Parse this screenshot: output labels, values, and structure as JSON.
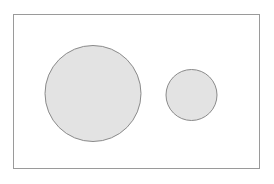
{
  "figure": {
    "canvas": {
      "width": 274,
      "height": 184,
      "background_color": "#ffffff"
    },
    "frame": {
      "name": "bounding-rectangle",
      "x": 13.5,
      "y": 14.5,
      "width": 246,
      "height": 154,
      "fill_color": "#ffffff",
      "stroke_color": "#9a9a9a",
      "stroke_width": 1
    },
    "shapes": [
      {
        "name": "large-circle",
        "type": "circle",
        "cx": 93,
        "cy": 93.5,
        "r": 48,
        "diameter": 96,
        "fill_color": "#e3e3e3",
        "stroke_color": "#8a8a8a",
        "stroke_width": 1
      },
      {
        "name": "small-circle",
        "type": "circle",
        "cx": 191.5,
        "cy": 95,
        "r": 25.5,
        "diameter": 51,
        "fill_color": "#e3e3e3",
        "stroke_color": "#8a8a8a",
        "stroke_width": 1
      }
    ]
  },
  "chart_data": {
    "type": "scatter",
    "title": "",
    "xlabel": "",
    "ylabel": "",
    "xlim": [
      13.5,
      259.5
    ],
    "ylim": [
      14.5,
      168.5
    ],
    "grid": false,
    "legend": "none",
    "categories": [
      "large-circle",
      "small-circle"
    ],
    "values": [
      96,
      51
    ],
    "series": [
      {
        "name": "circle diameter (px)",
        "values": [
          96,
          51
        ]
      },
      {
        "name": "circle center x (px)",
        "values": [
          93,
          191.5
        ]
      },
      {
        "name": "circle center y (px)",
        "values": [
          93.5,
          95
        ]
      }
    ],
    "annotations": []
  }
}
